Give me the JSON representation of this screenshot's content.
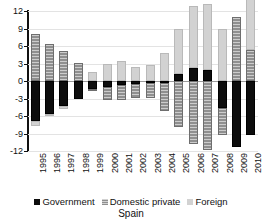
{
  "chart_data": {
    "type": "bar",
    "title": "Spain",
    "subtitle": "",
    "xlabel": "",
    "ylabel": "",
    "ylim": [
      -12,
      12
    ],
    "yticks": [
      12,
      9,
      6,
      3,
      0,
      -3,
      -6,
      -9,
      -12
    ],
    "ytick_labels": [
      "12",
      "9",
      "6",
      "3",
      "0",
      "-3",
      "-6",
      "-9",
      "-12"
    ],
    "grid": true,
    "stacked": true,
    "legend_position": "bottom",
    "categories": [
      "1995",
      "1996",
      "1997",
      "1998",
      "1999",
      "2000",
      "2001",
      "2002",
      "2003",
      "2004",
      "2005",
      "2006",
      "2007",
      "2008",
      "2009",
      "2010"
    ],
    "series": [
      {
        "name": "Government",
        "color": "#0d0d0d",
        "values": [
          -6.9,
          -5.6,
          -4.2,
          -3.1,
          -1.4,
          -1.1,
          -0.7,
          -0.5,
          -0.4,
          -0.3,
          1.2,
          2.2,
          1.9,
          -4.7,
          -11.3,
          -9.3
        ]
      },
      {
        "name": "Domestic private",
        "color": "#8f8f8f",
        "values": [
          8.0,
          6.4,
          5.2,
          3.1,
          -0.3,
          -2.2,
          -2.6,
          -2.4,
          -2.5,
          -4.8,
          -7.8,
          -10.8,
          -11.8,
          -4.5,
          11.0,
          5.3
        ]
      },
      {
        "name": "Foreign",
        "color": "#d2d2d2",
        "values": [
          -0.8,
          -0.4,
          -0.6,
          0.0,
          1.5,
          3.0,
          3.4,
          2.4,
          2.8,
          4.8,
          7.8,
          10.6,
          11.3,
          9.0,
          0.0,
          9.0
        ]
      }
    ],
    "legend": [
      {
        "label": "Government",
        "swatch": "gov"
      },
      {
        "label": "Domestic private",
        "swatch": "dom"
      },
      {
        "label": "Foreign",
        "swatch": "for"
      }
    ]
  }
}
